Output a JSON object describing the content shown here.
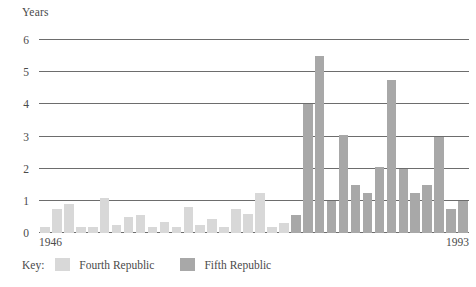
{
  "figure": {
    "y_axis_title": "Years",
    "x_start_label": "1946",
    "x_end_label": "1993"
  },
  "legend": {
    "key_label": "Key:",
    "entries": [
      {
        "label": "Fourth Republic",
        "color": "#d8d8d8"
      },
      {
        "label": "Fifth Republic",
        "color": "#a8a8a8"
      }
    ]
  },
  "colors": {
    "fourth_republic": "#d8d8d8",
    "fifth_republic": "#a8a8a8",
    "gridline": "#6d6d6d",
    "text": "#4a4a4a",
    "background": "#ffffff"
  },
  "chart_data": {
    "type": "bar",
    "title": "",
    "xlabel": "",
    "ylabel": "Years",
    "ylim": [
      0,
      6
    ],
    "yticks": [
      0,
      1,
      2,
      3,
      4,
      5,
      6
    ],
    "ytick_labels": [
      "0",
      "1",
      "2",
      "3",
      "4",
      "5",
      "6"
    ],
    "grid": true,
    "legend_position": "below-left",
    "x_range_labels": [
      "1946",
      "1993"
    ],
    "series": [
      {
        "name": "Fourth Republic",
        "color": "#d8d8d8",
        "values": [
          0.2,
          0.75,
          0.9,
          0.2,
          0.2,
          1.1,
          0.25,
          0.5,
          0.55,
          0.2,
          0.35,
          0.2,
          0.8,
          0.25,
          0.45,
          0.2,
          0.75,
          0.6,
          1.25,
          0.2,
          0.3
        ]
      },
      {
        "name": "Fifth Republic",
        "color": "#a8a8a8",
        "values": [
          0.55,
          4.0,
          5.5,
          1.0,
          3.05,
          1.5,
          1.25,
          2.05,
          4.75,
          2.0,
          1.25,
          1.5,
          3.0,
          0.75,
          1.0
        ]
      }
    ],
    "bar_count_total": 36,
    "peak_value": 5.5,
    "peak_series": "Fifth Republic"
  }
}
